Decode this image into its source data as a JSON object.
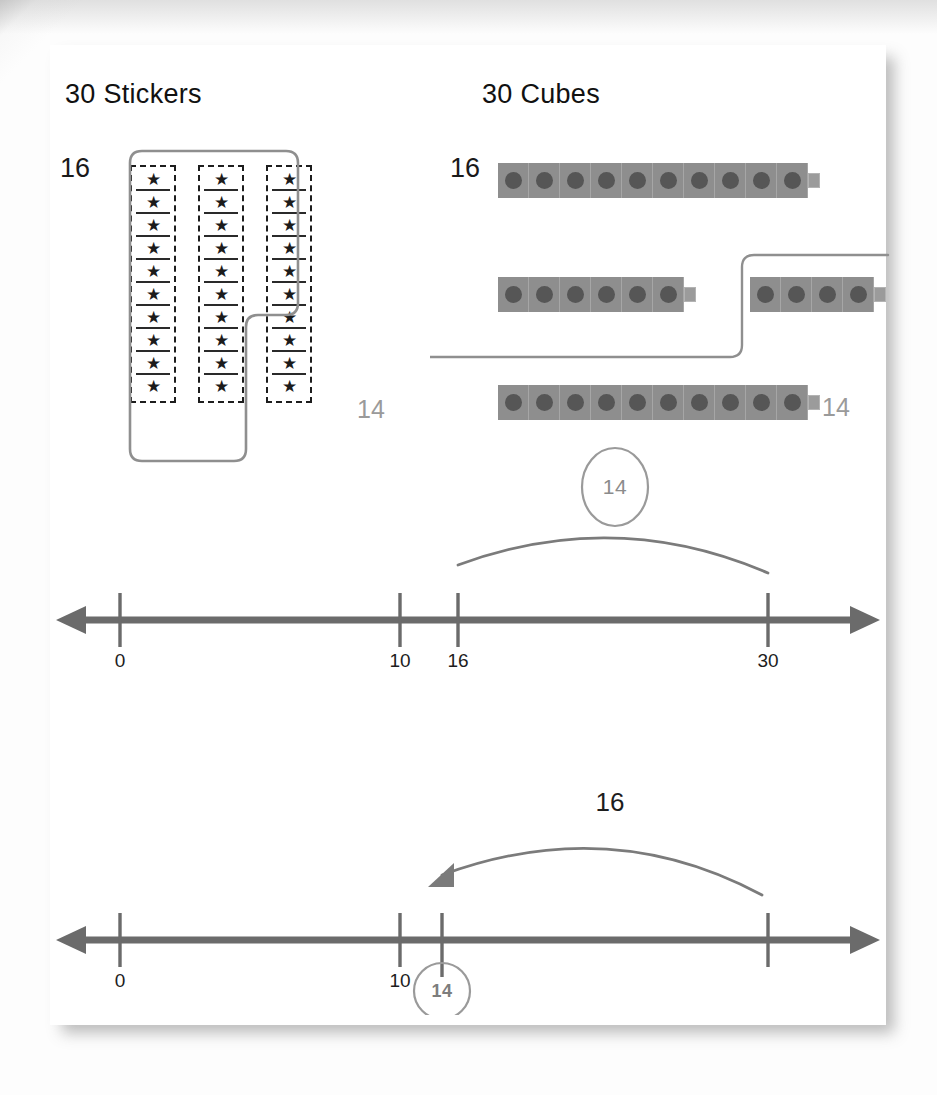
{
  "headers": {
    "stickers": "30 Stickers",
    "cubes": "30 Cubes"
  },
  "stickers": {
    "group_label": "16",
    "remainder_label": "14",
    "star_glyph": "★",
    "columns": [
      10,
      10,
      10
    ],
    "grouped_count": 16,
    "remainder_count": 14,
    "total": 30
  },
  "cubes": {
    "group_label": "16",
    "remainder_label": "14",
    "rows": [
      {
        "segments": [
          10
        ]
      },
      {
        "segments": [
          6,
          4
        ]
      },
      {
        "segments": [
          10
        ]
      }
    ],
    "grouped_count": 16,
    "remainder_count": 14,
    "total": 30
  },
  "numberline1": {
    "ticks": [
      {
        "label": "0",
        "value": 0
      },
      {
        "label": "10",
        "value": 10
      },
      {
        "label": "16",
        "value": 16
      },
      {
        "label": "30",
        "value": 30
      }
    ],
    "arc": {
      "from": 16,
      "to": 30,
      "label": "14",
      "direction": "right"
    },
    "badge": "14"
  },
  "numberline2": {
    "ticks": [
      {
        "label": "0",
        "value": 0
      },
      {
        "label": "10",
        "value": 10
      },
      {
        "label": "",
        "value": 14
      },
      {
        "label": "30",
        "value": 30
      }
    ],
    "arc": {
      "from": 30,
      "to": 14,
      "label": "16",
      "direction": "left"
    },
    "badge": "14"
  },
  "colors": {
    "axis": "#6b6b6b",
    "cube_body": "#8e8e8e",
    "cube_dot": "#565656",
    "outline": "#8f8f8f",
    "ink": "#1b1b1b",
    "muted": "#9a9a9a",
    "card": "#ffffff"
  },
  "chart_data": {
    "type": "table",
    "representations": [
      "sticker strips",
      "connecting cubes",
      "number line (forward)",
      "number line (backward)"
    ],
    "whole": 30,
    "parts": [
      16,
      14
    ],
    "numberline_ticks": [
      0,
      10,
      16,
      30
    ],
    "numberline2_ticks": [
      0,
      10,
      14,
      30
    ],
    "jumps": [
      {
        "model": "numberline1",
        "start": 16,
        "end": 30,
        "size": 14
      },
      {
        "model": "numberline2",
        "start": 30,
        "end": 14,
        "size": 16
      }
    ]
  }
}
